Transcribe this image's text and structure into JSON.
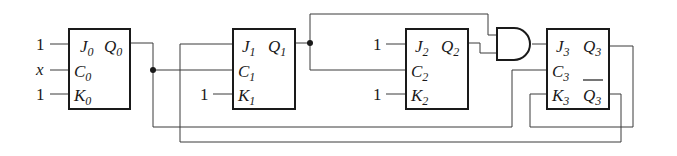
{
  "diagram": {
    "type": "sequential-logic-circuit",
    "components": {
      "ff0": {
        "j": "J",
        "j_sub": "0",
        "q": "Q",
        "q_sub": "0",
        "c": "C",
        "c_sub": "0",
        "k": "K",
        "k_sub": "0"
      },
      "ff1": {
        "j": "J",
        "j_sub": "1",
        "q": "Q",
        "q_sub": "1",
        "c": "C",
        "c_sub": "1",
        "k": "K",
        "k_sub": "1"
      },
      "ff2": {
        "j": "J",
        "j_sub": "2",
        "q": "Q",
        "q_sub": "2",
        "c": "C",
        "c_sub": "2",
        "k": "K",
        "k_sub": "2"
      },
      "ff3": {
        "j": "J",
        "j_sub": "3",
        "q": "Q",
        "q_sub": "3",
        "c": "C",
        "c_sub": "3",
        "k": "K",
        "k_sub": "3",
        "qbar": "Q",
        "qbar_sub": "3"
      },
      "and_gate": {
        "label": "AND"
      }
    },
    "inputs": {
      "ff0_j": "1",
      "ff0_c": "x",
      "ff0_k": "1",
      "ff1_k": "1",
      "ff2_j": "1",
      "ff2_k": "1"
    }
  }
}
